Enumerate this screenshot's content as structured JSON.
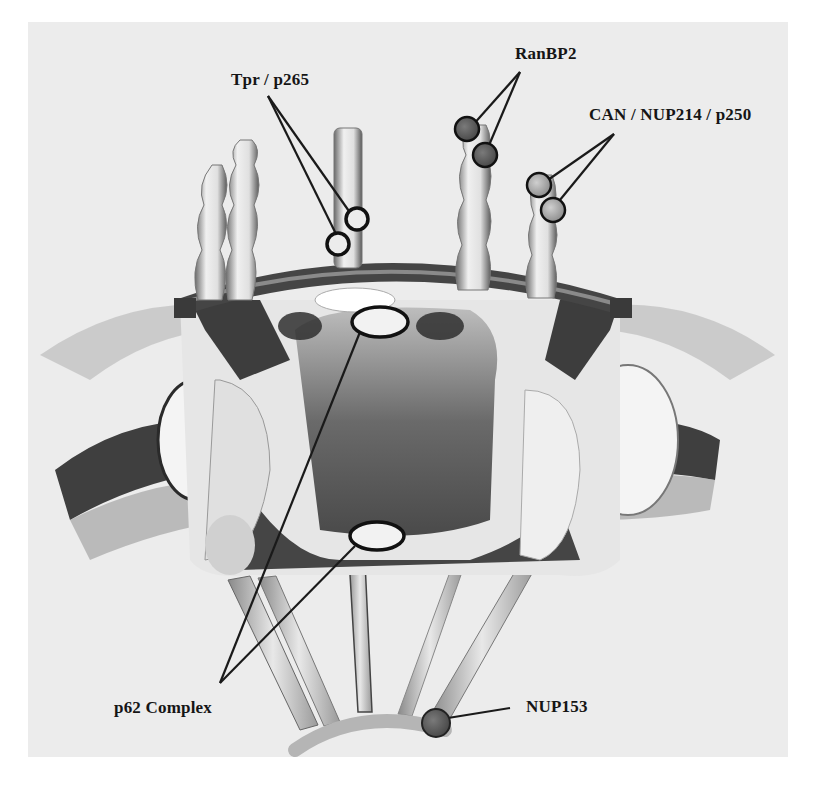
{
  "figure": {
    "colors": {
      "background": "#ececec",
      "structure_dark": "#3a3a3a",
      "structure_mid": "#7a7a7a",
      "structure_light": "#d8d8d8",
      "marker_dark_fill": "#5a5a5a",
      "marker_light_fill": "#bdbdbd",
      "marker_open_fill": "#ececec",
      "leader_line": "#1a1a1a"
    },
    "labels": {
      "tpr": "Tpr / p265",
      "ranbp2": "RanBP2",
      "can": "CAN / NUP214 / p250",
      "p62": "p62 Complex",
      "nup153": "NUP153"
    },
    "markers": [
      {
        "id": "tpr-1",
        "protein": "Tpr / p265",
        "style": "open-circle"
      },
      {
        "id": "tpr-2",
        "protein": "Tpr / p265",
        "style": "open-circle"
      },
      {
        "id": "ranbp2-1",
        "protein": "RanBP2",
        "style": "dark-filled"
      },
      {
        "id": "ranbp2-2",
        "protein": "RanBP2",
        "style": "dark-filled"
      },
      {
        "id": "can-1",
        "protein": "CAN / NUP214 / p250",
        "style": "light-filled"
      },
      {
        "id": "can-2",
        "protein": "CAN / NUP214 / p250",
        "style": "light-filled"
      },
      {
        "id": "p62-top",
        "protein": "p62 Complex",
        "style": "open-ellipse"
      },
      {
        "id": "p62-bottom",
        "protein": "p62 Complex",
        "style": "open-ellipse"
      },
      {
        "id": "nup153-1",
        "protein": "NUP153",
        "style": "dark-filled"
      }
    ]
  }
}
